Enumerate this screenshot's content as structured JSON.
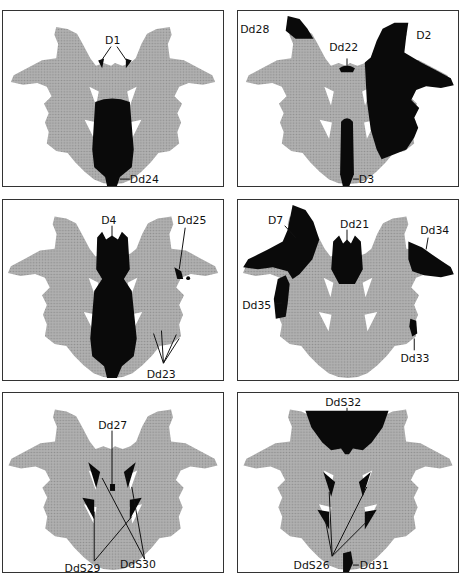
{
  "figure": {
    "colors": {
      "blot": "#a6a6a6",
      "highlight": "#0a0a0a",
      "border": "#333333",
      "background": "#ffffff"
    }
  },
  "panels": [
    {
      "id": "p1",
      "labels": [
        "D1",
        "Dd24"
      ]
    },
    {
      "id": "p2",
      "labels": [
        "Dd28",
        "Dd22",
        "D2",
        "D3"
      ]
    },
    {
      "id": "p3",
      "labels": [
        "D4",
        "Dd25",
        "Dd23"
      ]
    },
    {
      "id": "p4",
      "labels": [
        "D7",
        "Dd21",
        "Dd34",
        "Dd35",
        "Dd33"
      ]
    },
    {
      "id": "p5",
      "labels": [
        "Dd27",
        "DdS29",
        "DdS30"
      ]
    },
    {
      "id": "p6",
      "labels": [
        "DdS32",
        "DdS26",
        "Dd31"
      ]
    }
  ]
}
